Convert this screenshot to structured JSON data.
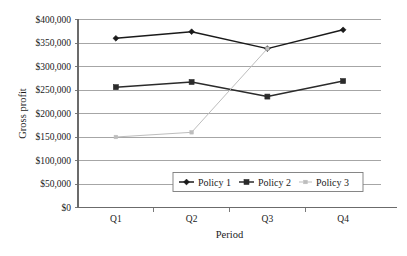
{
  "chart_data": {
    "type": "line",
    "title": "",
    "xlabel": "Period",
    "ylabel": "Gross profit",
    "categories": [
      "Q1",
      "Q2",
      "Q3",
      "Q4"
    ],
    "ylim": [
      0,
      400000
    ],
    "ytick_step": 50000,
    "ytick_labels": [
      "$0",
      "$50,000",
      "$100,000",
      "$150,000",
      "$200,000",
      "$250,000",
      "$300,000",
      "$350,000",
      "$400,000"
    ],
    "ytick_values": [
      0,
      50000,
      100000,
      150000,
      200000,
      250000,
      300000,
      350000,
      400000
    ],
    "grid": "horizontal",
    "legend_position": "inside-bottom-right",
    "series": [
      {
        "name": "Policy 1",
        "marker": "diamond",
        "color": "#1a1a1a",
        "values": [
          360000,
          374000,
          338000,
          378000
        ]
      },
      {
        "name": "Policy 2",
        "marker": "square",
        "color": "#2b2b2b",
        "values": [
          256000,
          267000,
          236000,
          269000
        ]
      },
      {
        "name": "Policy 3",
        "marker": "square-small",
        "color": "#bdbdbd",
        "values": [
          150000,
          160000,
          338000,
          null
        ]
      }
    ]
  },
  "axis": {
    "y_label": "Gross profit",
    "x_label": "Period",
    "y_ticks": [
      "$400,000",
      "$350,000",
      "$300,000",
      "$250,000",
      "$200,000",
      "$150,000",
      "$100,000",
      "$50,000",
      "$0"
    ],
    "x_ticks": [
      "Q1",
      "Q2",
      "Q3",
      "Q4"
    ]
  },
  "legend": {
    "items": [
      {
        "label": "Policy 1"
      },
      {
        "label": "Policy 2"
      },
      {
        "label": "Policy 3"
      }
    ]
  },
  "colors": {
    "series1": "#1a1a1a",
    "series2": "#2b2b2b",
    "series3": "#bdbdbd",
    "gridline": "#808080",
    "axis": "#6b6b6b",
    "text": "#1a1a1a",
    "background": "#ffffff"
  }
}
